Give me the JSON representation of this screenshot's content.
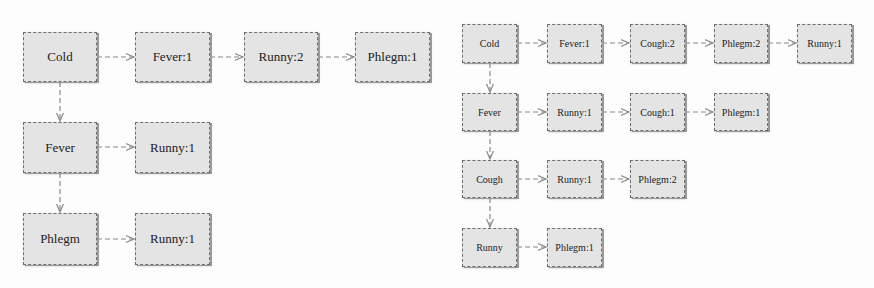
{
  "diagrams": [
    {
      "name": "left-tree",
      "rows": [
        {
          "head": "Cold",
          "items": [
            "Fever:1",
            "Runny:2",
            "Phlegm:1"
          ]
        },
        {
          "head": "Fever",
          "items": [
            "Runny:1"
          ]
        },
        {
          "head": "Phlegm",
          "items": [
            "Runny:1"
          ]
        }
      ]
    },
    {
      "name": "right-tree",
      "rows": [
        {
          "head": "Cold",
          "items": [
            "Fever:1",
            "Cough:2",
            "Phlegm:2",
            "Runny:1"
          ]
        },
        {
          "head": "Fever",
          "items": [
            "Runny:1",
            "Cough:1",
            "Phlegm:1"
          ]
        },
        {
          "head": "Cough",
          "items": [
            "Runny:1",
            "Phlegm:2"
          ]
        },
        {
          "head": "Runny",
          "items": [
            "Phlegm:1"
          ]
        }
      ]
    }
  ],
  "colors": {
    "node_fill": "#e4e4e4",
    "node_border": "#6e6e6e",
    "edge": "#8a8a8a",
    "background": "#fdfdfd"
  }
}
